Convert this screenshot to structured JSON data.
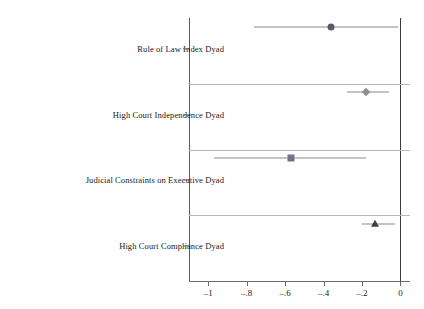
{
  "chart_data": {
    "type": "scatter",
    "title": "",
    "subtitle": "",
    "xlabel": "",
    "ylabel": "",
    "xlim": [
      -1.1,
      0.05
    ],
    "ylim": [
      0,
      4
    ],
    "grid": "horizontal-separators-only",
    "legend": "none",
    "orientation": "horizontal",
    "reference_line": 0,
    "xticks": [
      {
        "value": -1,
        "label": "–1"
      },
      {
        "value": -0.8,
        "label": "–.8"
      },
      {
        "value": -0.6,
        "label": "–.6"
      },
      {
        "value": -0.4,
        "label": "–.4"
      },
      {
        "value": -0.2,
        "label": "–.2"
      },
      {
        "value": 0,
        "label": "0"
      }
    ],
    "categories": [
      "Rule of Law Index Dyad",
      "High Court Independence Dyad",
      "Judicial Constraints on Executive Dyad",
      "High Court Compliance Dyad"
    ],
    "points": [
      {
        "category": "Rule of Law Index Dyad",
        "estimate": -0.36,
        "ci_low": -0.76,
        "ci_high": -0.01,
        "marker": "circle",
        "color": "#555a66"
      },
      {
        "category": "High Court Independence Dyad",
        "estimate": -0.18,
        "ci_low": -0.28,
        "ci_high": -0.06,
        "marker": "diamond",
        "color": "#8e8e98"
      },
      {
        "category": "Judicial Constraints on Executive Dyad",
        "estimate": -0.57,
        "ci_low": -0.97,
        "ci_high": -0.18,
        "marker": "square",
        "color": "#6e7480"
      },
      {
        "category": "High Court Compliance Dyad",
        "estimate": -0.13,
        "ci_low": -0.2,
        "ci_high": -0.03,
        "marker": "triangle",
        "color": "#3c3f48"
      }
    ],
    "colors": {
      "axis": "#5d5d5d",
      "gridline": "#b9b9b9",
      "zero_line": "#3a3a3a",
      "whisker": "#8a8a8a",
      "background": "#ffffff"
    }
  }
}
